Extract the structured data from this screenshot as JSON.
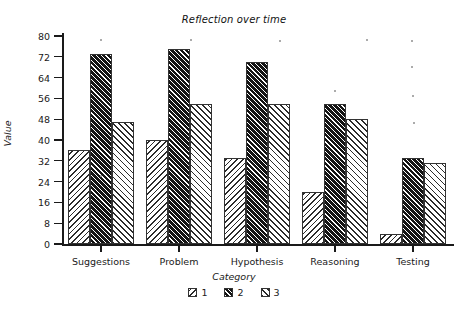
{
  "chart_data": {
    "type": "bar",
    "title": "Reflection over time",
    "xlabel": "Category",
    "ylabel": "Value",
    "categories": [
      "Suggestions",
      "Problem",
      "Hypothesis",
      "Reasoning",
      "Testing"
    ],
    "series": [
      {
        "name": "1",
        "values": [
          36,
          40,
          33,
          20,
          4
        ]
      },
      {
        "name": "2",
        "values": [
          73,
          75,
          70,
          54,
          33
        ]
      },
      {
        "name": "3",
        "values": [
          47,
          54,
          54,
          48,
          31
        ]
      }
    ],
    "ylim": [
      0,
      80
    ],
    "yticks": [
      0,
      8,
      16,
      24,
      32,
      40,
      48,
      56,
      64,
      72,
      80
    ],
    "grid": false,
    "legend_position": "bottom",
    "legend_entries": [
      "1",
      "2",
      "3"
    ],
    "bar_styles": [
      "hatch-backward-light",
      "hatch-forward-dark",
      "hatch-forward-light"
    ],
    "colors": {
      "series_1_fill": "#ffffff",
      "series_2_fill": "#141414",
      "series_3_fill": "#ffffff",
      "edge": "#333333",
      "axis": "#1a1a1a",
      "background": "#ffffff"
    }
  }
}
